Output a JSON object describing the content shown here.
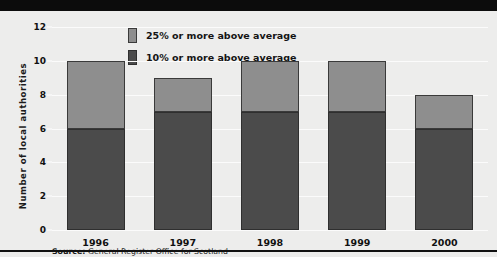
{
  "chart_data": {
    "type": "bar",
    "subtype": "stacked-column",
    "title": "",
    "subtitle": "",
    "xlabel": "",
    "ylabel": "Number of local authorities",
    "categories": [
      "1996",
      "1997",
      "1998",
      "1999",
      "2000"
    ],
    "series": [
      {
        "name": "10% or more above average",
        "color": "#4b4b4b",
        "values": [
          6,
          7,
          7,
          7,
          6
        ]
      },
      {
        "name": "25% or more above average",
        "color": "#8e8e8e",
        "values": [
          4,
          2,
          3,
          3,
          2
        ]
      }
    ],
    "totals": [
      10,
      9,
      10,
      10,
      8
    ],
    "ylim": [
      0,
      12
    ],
    "ytick_step": 2,
    "yticks": [
      "0",
      "2",
      "4",
      "6",
      "8",
      "10",
      "12"
    ],
    "grid": true,
    "grid_axis": "y",
    "legend_position": "top-center",
    "stack_order_bottom_to_top": [
      "10% or more above average",
      "25% or more above average"
    ]
  },
  "legend": {
    "items": [
      {
        "label": "25% or more above average",
        "swatch": "light-gray-swatch"
      },
      {
        "label": "10% or more above average",
        "swatch": "dark-gray-swatch"
      }
    ]
  },
  "footer": {
    "source_prefix": "Source:",
    "source_text": " General Register Office for Scotland"
  },
  "colors": {
    "background": "#ededec",
    "top_band": "#0c0c0c",
    "gridline": "#fbfbfb",
    "series_dark": "#4b4b4b",
    "series_light": "#8e8e8e",
    "text": "#111111"
  }
}
